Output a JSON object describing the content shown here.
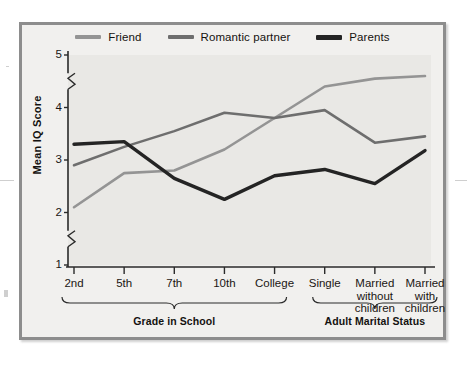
{
  "figure": {
    "background_color": "#e9e8e5",
    "border_color": "#8d8d8d"
  },
  "legend": {
    "position": "top-center",
    "items": [
      {
        "label": "Friend",
        "color": "#949494",
        "name": "legend-item-friend"
      },
      {
        "label": "Romantic partner",
        "color": "#6e6e6e",
        "name": "legend-item-romantic-partner"
      },
      {
        "label": "Parents",
        "color": "#242424",
        "name": "legend-item-parents"
      }
    ]
  },
  "axes": {
    "y_title": "Mean IQ Score",
    "y_ticks": [
      "1",
      "2",
      "3",
      "4",
      "5"
    ],
    "y_break_marks": [
      {
        "between": "1-2"
      },
      {
        "between": "4-5"
      }
    ],
    "x_tick_labels": [
      "2nd",
      "5th",
      "7th",
      "10th",
      "College",
      "Single",
      "Married\nwithout\nchildren",
      "Married\nwith\nchildren"
    ]
  },
  "groups": [
    {
      "label": "Grade in School",
      "from": 0,
      "to": 4
    },
    {
      "label": "Adult Marital Status",
      "from": 5,
      "to": 7
    }
  ],
  "chart_data": {
    "type": "line",
    "title": "",
    "xlabel": "",
    "ylabel": "Mean IQ Score",
    "ylim": [
      1,
      5
    ],
    "ytick_step": 1,
    "gridline_step": 0.25,
    "grid": true,
    "legend_position": "top-center",
    "categories": [
      "2nd",
      "5th",
      "7th",
      "10th",
      "College",
      "Single",
      "Married without children",
      "Married with children"
    ],
    "category_groups": [
      "Grade in School",
      "Grade in School",
      "Grade in School",
      "Grade in School",
      "Grade in School",
      "Adult Marital Status",
      "Adult Marital Status",
      "Adult Marital Status"
    ],
    "series": [
      {
        "name": "Friend",
        "color": "#949494",
        "values": [
          2.1,
          2.75,
          2.8,
          3.2,
          3.8,
          4.4,
          4.55,
          4.6
        ]
      },
      {
        "name": "Romantic partner",
        "color": "#6e6e6e",
        "values": [
          2.9,
          3.25,
          3.55,
          3.9,
          3.8,
          3.95,
          3.33,
          3.45
        ]
      },
      {
        "name": "Parents",
        "color": "#242424",
        "values": [
          3.3,
          3.35,
          2.65,
          2.25,
          2.7,
          2.82,
          2.55,
          3.18
        ]
      }
    ]
  }
}
